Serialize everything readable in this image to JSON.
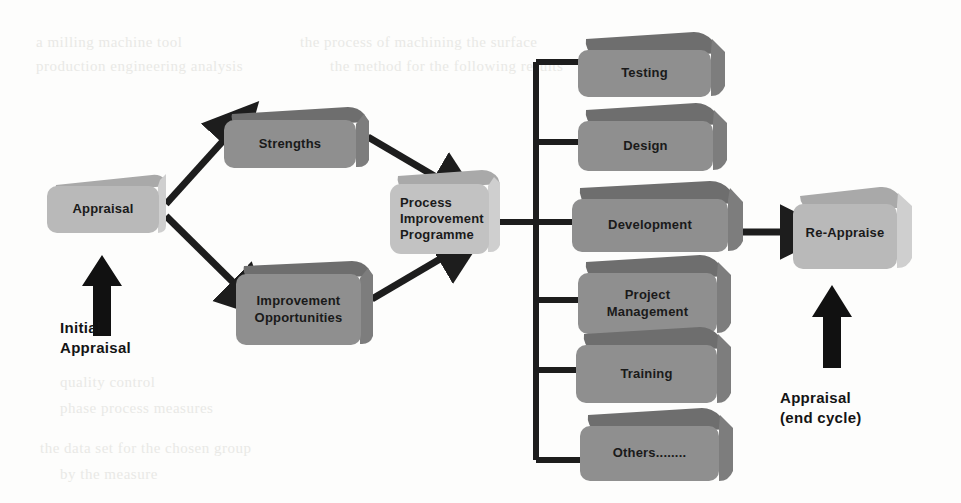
{
  "diagram": {
    "background_color": "#fdfdfc",
    "palette": {
      "box_light_face": "#b9b9b9",
      "box_light_top": "#a9a9a9",
      "box_light_side": "#cfcfcf",
      "box_dark_face": "#8f8f8f",
      "box_dark_top": "#6e6e6e",
      "box_dark_side": "#7d7d7d",
      "connector": "#1d1d1d",
      "text": "#1a1a1a"
    },
    "nodes": {
      "appraisal": {
        "label": "Appraisal",
        "tone": "light"
      },
      "strengths": {
        "label": "Strengths",
        "tone": "dark"
      },
      "improvement_opportunities": {
        "label": "Improvement\nOpportunities",
        "tone": "dark"
      },
      "process_improvement_programme": {
        "label": "Process\nImprovement\nProgramme",
        "tone": "light"
      },
      "re_appraise": {
        "label": "Re-Appraise",
        "tone": "light"
      },
      "testing": {
        "label": "Testing",
        "tone": "dark"
      },
      "design": {
        "label": "Design",
        "tone": "dark"
      },
      "development": {
        "label": "Development",
        "tone": "dark"
      },
      "project_management": {
        "label": "Project\nManagement",
        "tone": "dark"
      },
      "training": {
        "label": "Training",
        "tone": "dark"
      },
      "others": {
        "label": "Others........",
        "tone": "dark"
      }
    },
    "captions": {
      "initial_appraisal": "Initial\nAppraisal",
      "end_cycle_appraisal": "Appraisal\n(end cycle)"
    },
    "ghost_text": [
      {
        "text": "a  milling      machine      tool",
        "x": 36,
        "y": 34
      },
      {
        "text": "the  process   of   machining   the  surface",
        "x": 300,
        "y": 34
      },
      {
        "text": "production      engineering        analysis",
        "x": 36,
        "y": 58
      },
      {
        "text": "the  method  for  the  following  results",
        "x": 330,
        "y": 58
      },
      {
        "text": "quality   control",
        "x": 60,
        "y": 374
      },
      {
        "text": "phase   process   measures",
        "x": 60,
        "y": 400
      },
      {
        "text": "the    data   set   for    the  chosen  group",
        "x": 40,
        "y": 440
      },
      {
        "text": "by     the     measure",
        "x": 60,
        "y": 466
      }
    ]
  }
}
